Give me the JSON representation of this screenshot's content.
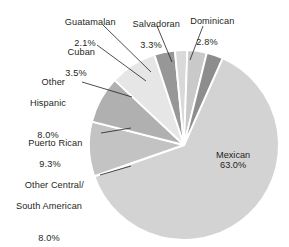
{
  "chart_data": {
    "type": "pie",
    "title": "",
    "subtitle": "",
    "xlabel": "",
    "ylabel": "",
    "legend_position": "callout-labels",
    "grid": false,
    "units": "percent",
    "total": 100.0,
    "categories": [
      "Mexican",
      "Puerto Rican",
      "Other Central/\nSouth American",
      "Other\nHispanic",
      "Cuban",
      "Guatamalan",
      "Salvadoran",
      "Dominican"
    ],
    "values": [
      63.0,
      9.3,
      8.0,
      8.0,
      3.5,
      2.1,
      3.3,
      2.8
    ],
    "value_labels": [
      "63.0%",
      "9.3%",
      "8.0%",
      "8.0%",
      "3.5%",
      "2.1%",
      "3.3%",
      "2.8%"
    ],
    "slices": [
      {
        "name": "Mexican",
        "value": 63.0,
        "label": "Mexican",
        "pct": "63.0%",
        "color": "#d3d3d3",
        "label_placement": "inside"
      },
      {
        "name": "Puerto Rican",
        "value": 9.3,
        "label": "Puerto Rican",
        "pct": "9.3%",
        "color": "#c3c3c3",
        "label_placement": "leader-left"
      },
      {
        "name": "Other Central/South American",
        "value": 8.0,
        "label_line1": "Other Central/",
        "label_line2": "South American",
        "pct": "8.0%",
        "color": "#b0b0b0",
        "label_placement": "leader-left"
      },
      {
        "name": "Other Hispanic",
        "value": 8.0,
        "label_line1": "Other",
        "label_line2": "Hispanic",
        "pct": "8.0%",
        "color": "#e6e6e6",
        "label_placement": "leader-left"
      },
      {
        "name": "Cuban",
        "value": 3.5,
        "label": "Cuban",
        "pct": "3.5%",
        "color": "#979797",
        "label_placement": "leader-upper-left"
      },
      {
        "name": "Guatamalan",
        "value": 2.1,
        "label": "Guatamalan",
        "pct": "2.1%",
        "color": "#d9d9d9",
        "label_placement": "leader-top"
      },
      {
        "name": "Salvadoran",
        "value": 3.3,
        "label": "Salvadoran",
        "pct": "3.3%",
        "color": "#c9c9c9",
        "label_placement": "leader-top"
      },
      {
        "name": "Dominican",
        "value": 2.8,
        "label": "Dominican",
        "pct": "2.8%",
        "color": "#8d8d8d",
        "label_placement": "leader-top-right"
      }
    ],
    "colors": {
      "background": "#ffffff",
      "text": "#231f20",
      "separator": "#ffffff",
      "leader_line": "#231f20"
    }
  },
  "labels": {
    "guatamalan": {
      "name": "Guatamalan",
      "pct": "2.1%"
    },
    "salvadoran": {
      "name": "Salvadoran",
      "pct": "3.3%"
    },
    "dominican": {
      "name": "Dominican",
      "pct": "2.8%"
    },
    "cuban": {
      "name": "Cuban",
      "pct": "3.5%"
    },
    "other_hispanic": {
      "line1": "Other",
      "line2": "Hispanic",
      "pct": "8.0%"
    },
    "puerto_rican": {
      "name": "Puerto Rican",
      "pct": "9.3%"
    },
    "other_central_south": {
      "line1": "Other Central/",
      "line2": "South American",
      "pct": "8.0%"
    },
    "mexican": {
      "name": "Mexican",
      "pct": "63.0%"
    }
  }
}
